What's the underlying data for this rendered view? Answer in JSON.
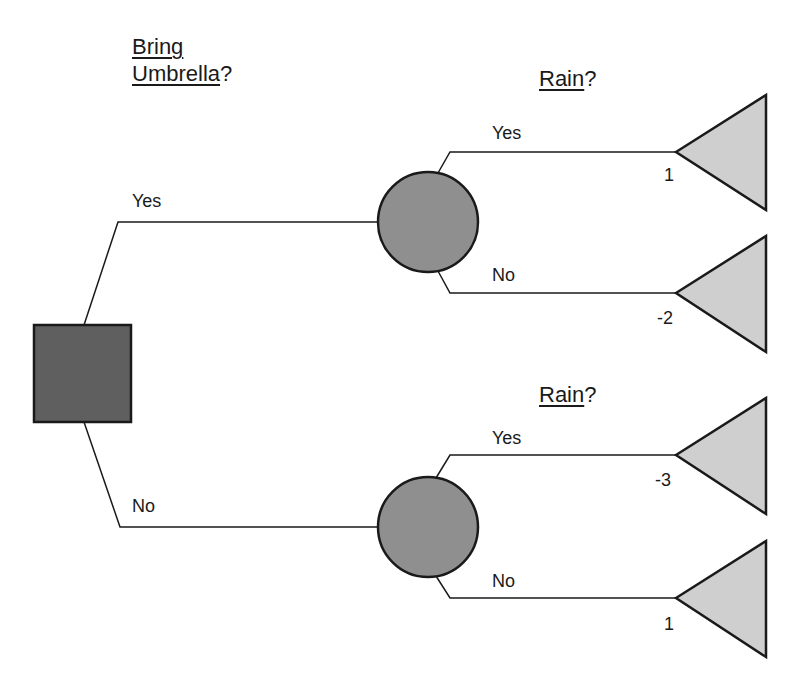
{
  "decision": {
    "title_line1": "Bring",
    "title_line2": "Umbrella",
    "title_suffix": "?",
    "branches": [
      "Yes",
      "No"
    ]
  },
  "chance_nodes": [
    {
      "title": "Rain",
      "suffix": "?",
      "branches": [
        {
          "label": "Yes",
          "payoff": "1"
        },
        {
          "label": "No",
          "payoff": "-2"
        }
      ]
    },
    {
      "title": "Rain",
      "suffix": "?",
      "branches": [
        {
          "label": "Yes",
          "payoff": "-3"
        },
        {
          "label": "No",
          "payoff": "1"
        }
      ]
    }
  ],
  "colors": {
    "decision_fill": "#5f5f5f",
    "chance_fill": "#8f8f8f",
    "terminal_fill": "#cfcfcf",
    "stroke": "#1a1a1a"
  }
}
